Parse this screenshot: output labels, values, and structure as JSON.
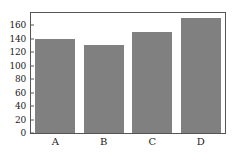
{
  "chart_data": {
    "type": "bar",
    "title": "",
    "subtitle": "",
    "xlabel": "",
    "ylabel": "",
    "categories": [
      "A",
      "B",
      "C",
      "D"
    ],
    "values": [
      140,
      130,
      150,
      170
    ],
    "ylim": [
      0,
      178
    ],
    "xlim": [
      0,
      4
    ],
    "yticks": [
      0,
      20,
      40,
      60,
      80,
      100,
      120,
      140,
      160
    ],
    "ytick_labels": [
      "0",
      "20",
      "40",
      "60",
      "80",
      "100",
      "120",
      "140",
      "160"
    ],
    "grid": false,
    "legend": false,
    "legend_position": "none",
    "bar_color": "#808080",
    "frame_color": "#555555",
    "background_color": "#ffffff"
  }
}
